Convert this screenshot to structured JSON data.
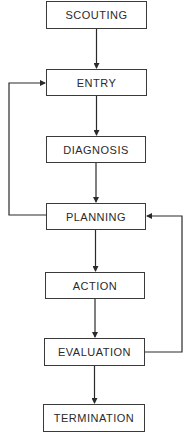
{
  "diagram": {
    "type": "flowchart",
    "colors": {
      "line": "#2a2a2a",
      "box_border": "#3a3a3a",
      "text": "#2a2a2a",
      "background": "#ffffff"
    },
    "nodes": [
      {
        "id": "scouting",
        "label": "SCOUTING"
      },
      {
        "id": "entry",
        "label": "ENTRY"
      },
      {
        "id": "diagnosis",
        "label": "DIAGNOSIS"
      },
      {
        "id": "planning",
        "label": "PLANNING"
      },
      {
        "id": "action",
        "label": "ACTION"
      },
      {
        "id": "evaluation",
        "label": "EVALUATION"
      },
      {
        "id": "termination",
        "label": "TERMINATION"
      }
    ],
    "edges": [
      {
        "from": "scouting",
        "to": "entry"
      },
      {
        "from": "entry",
        "to": "diagnosis"
      },
      {
        "from": "diagnosis",
        "to": "planning"
      },
      {
        "from": "planning",
        "to": "action"
      },
      {
        "from": "action",
        "to": "evaluation"
      },
      {
        "from": "evaluation",
        "to": "termination"
      },
      {
        "from": "planning",
        "to": "entry",
        "route": "left-loop"
      },
      {
        "from": "evaluation",
        "to": "planning",
        "route": "right-loop"
      }
    ]
  }
}
